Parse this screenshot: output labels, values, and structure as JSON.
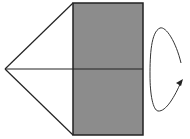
{
  "diagram": {
    "colors": {
      "background": "#ffffff",
      "stroke": "#222222",
      "rectangle_fill": "#8c8c8c",
      "arrow": "#333333"
    },
    "shapes": {
      "triangle": {
        "apex": [
          5,
          69
        ],
        "top": [
          73,
          3
        ],
        "bottom": [
          73,
          135
        ]
      },
      "rectangle": {
        "x": 73,
        "y": 3,
        "width": 70,
        "height": 132
      },
      "axis_line": {
        "x1": 5,
        "y1": 69,
        "x2": 143,
        "y2": 69
      },
      "rotation_arrow": {
        "direction": "rotation-around-axis"
      }
    }
  }
}
